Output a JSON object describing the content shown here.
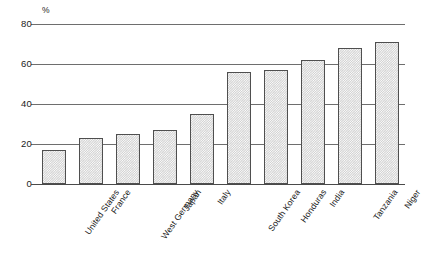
{
  "chart_data": {
    "type": "bar",
    "title": "",
    "subtitle": "",
    "xlabel": "",
    "ylabel": "",
    "unit_label": "%",
    "ylim": [
      0,
      80
    ],
    "ytick_values": [
      0,
      20,
      40,
      60,
      80
    ],
    "ytick_labels": [
      "0",
      "20",
      "40",
      "60",
      "80"
    ],
    "grid": true,
    "grid_axis": "y",
    "legend": false,
    "legend_position": "none",
    "categories": [
      "United States",
      "France",
      "West Germany",
      "Japan",
      "Italy",
      "South Korea",
      "Honduras",
      "India",
      "Tanzania",
      "Niger"
    ],
    "values": [
      17,
      23,
      25,
      27,
      35,
      56,
      57,
      62,
      68,
      71
    ],
    "bar_color": "#d2d2d2",
    "bar_edge_color": "#4f4f4f",
    "axis_color": "#4a4a4a",
    "grid_color": "#6e6e6e",
    "background_color": "#ffffff",
    "text_color": "#1a1a1a"
  }
}
